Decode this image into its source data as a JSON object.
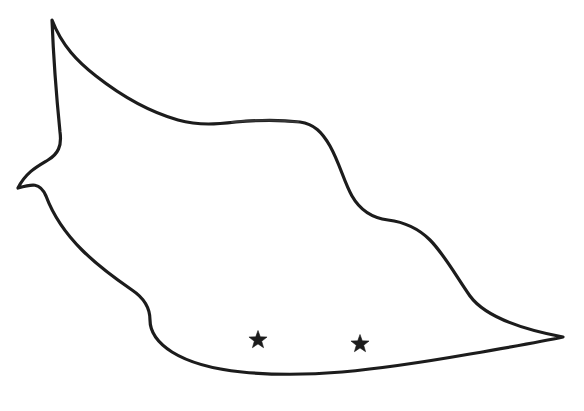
{
  "figure": {
    "background_color": "#ffffff",
    "stroke_color": "#1c1c1c",
    "faded_stroke_color": "#3c3c3c",
    "stroke_width": 3.2,
    "width": 584,
    "height": 411,
    "caption": ""
  },
  "shape": {
    "name": "region-outline",
    "kind": "closed-freehand-contour",
    "fill_color": "#ffffff",
    "path": "M 52 20 C 62 46 78 62 96 76 C 124 98 150 112 178 120 C 200 126 218 124 236 122 C 258 120 282 120 300 122 C 314 124 322 132 330 146 C 340 164 344 182 352 196 C 360 210 372 218 388 220 C 404 222 418 228 430 240 C 444 254 456 276 470 296 C 486 318 526 330 563 337 C 540 342 505 348 470 354 C 430 361 386 368 342 372 C 306 375 272 375 242 372 C 212 369 188 362 172 352 C 158 343 150 332 150 320 C 150 307 144 298 132 290 C 116 279 98 266 82 250 C 64 232 52 212 46 196 C 40 182 32 184 18 188 C 26 172 38 166 48 160 C 58 154 62 146 60 132 C 58 112 54 72 52 20 Z",
    "faded_segment_path": "M 232 122 C 252 120 278 120 298 122",
    "key_points": {
      "top_peak": [
        52,
        20
      ],
      "left_notch_corner": [
        18,
        188
      ],
      "right_tip": [
        563,
        337
      ],
      "bottom_low_point": [
        295,
        372
      ],
      "plateau_left": [
        232,
        122
      ],
      "plateau_right": [
        300,
        122
      ]
    }
  },
  "markers": [
    {
      "name": "star-marker-1",
      "symbol": "star",
      "color": "#1c1c1c",
      "cx": 258,
      "cy": 340,
      "radius": 9.5,
      "rotation": 0
    },
    {
      "name": "star-marker-2",
      "symbol": "star",
      "color": "#1c1c1c",
      "cx": 360,
      "cy": 344,
      "radius": 9.5,
      "rotation": 0
    }
  ]
}
